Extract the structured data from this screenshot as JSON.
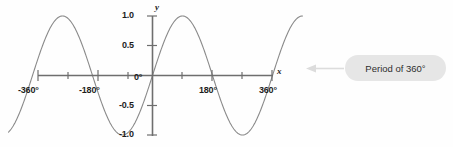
{
  "figure": {
    "axis_labels": {
      "x": "x",
      "y": "y"
    },
    "x_tick_labels": [
      "-360°",
      "-180°",
      "0°",
      "180°",
      "360°"
    ],
    "y_tick_labels": [
      "1.0",
      "0.5",
      "-0.5",
      "-1.0"
    ]
  },
  "callout": {
    "text": "Period of 360°",
    "arrow_name": "left-arrow"
  },
  "colors": {
    "curve": "#8a8a8a",
    "axis": "#6e6e6e",
    "text": "#1d1d1d",
    "callout_fill": "#e6e6e6",
    "callout_text": "#2e2e2e",
    "arrow": "#d8d8d8",
    "background": "#fefefe"
  },
  "chart_data": {
    "type": "line",
    "title": "",
    "xlabel": "x",
    "ylabel": "y",
    "xlim": [
      -360,
      360
    ],
    "ylim": [
      -1.0,
      1.0
    ],
    "grid": false,
    "legend": null,
    "xticks": [
      -360,
      -270,
      -180,
      -90,
      0,
      90,
      180,
      270,
      360
    ],
    "xticklabels": [
      "-360°",
      "",
      "-180°",
      "",
      "0°",
      "",
      "180°",
      "",
      "360°"
    ],
    "yticks": [
      -1.0,
      -0.5,
      0.5,
      1.0
    ],
    "yticklabels": [
      "-1.0",
      "-0.5",
      "0.5",
      "1.0"
    ],
    "annotations": [
      {
        "text": "Period of 360°",
        "points_to": "curve-right-end"
      }
    ],
    "series": [
      {
        "name": "sine",
        "function": "y = sin(x)",
        "period_degrees": 360,
        "amplitude": 1.0,
        "x": [
          -450,
          -420,
          -390,
          -360,
          -330,
          -300,
          -270,
          -240,
          -210,
          -180,
          -150,
          -120,
          -90,
          -60,
          -30,
          0,
          30,
          60,
          90,
          120,
          150,
          180,
          210,
          240,
          270,
          300,
          330,
          360,
          390,
          420,
          450
        ],
        "values": [
          -1.0,
          -0.866,
          -0.5,
          0.0,
          0.5,
          0.866,
          1.0,
          0.866,
          0.5,
          0.0,
          -0.5,
          -0.866,
          -1.0,
          -0.866,
          -0.5,
          0.0,
          0.5,
          0.866,
          1.0,
          0.866,
          0.5,
          0.0,
          -0.5,
          -0.866,
          -1.0,
          -0.866,
          -0.5,
          0.0,
          0.5,
          0.866,
          1.0
        ]
      }
    ]
  }
}
